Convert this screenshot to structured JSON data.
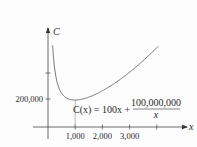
{
  "chart_data": {
    "type": "line",
    "title": "",
    "xlabel": "x",
    "ylabel": "C",
    "function": "C(x) = 100x + 100,000,000/x",
    "annotation": {
      "lhs": "C(x) = 100x +",
      "numerator": "100,000,000",
      "denominator": "x"
    },
    "x_ticks": [
      {
        "value": 1000,
        "label": "1,000"
      },
      {
        "value": 2000,
        "label": "2,000"
      },
      {
        "value": 3000,
        "label": "3,000"
      },
      {
        "value": 4000,
        "label": ""
      }
    ],
    "y_ticks": [
      {
        "value": 200000,
        "label": "200,000"
      },
      {
        "value": 400000,
        "label": ""
      }
    ],
    "minimum": {
      "x": 1000,
      "y": 200000
    },
    "x_domain": [
      170,
      4050
    ],
    "xlim": [
      -550,
      4800
    ],
    "ylim": [
      -80000,
      700000
    ],
    "grid": false,
    "legend": "none"
  }
}
